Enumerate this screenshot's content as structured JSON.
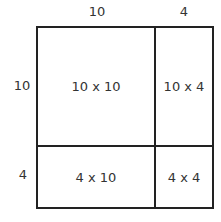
{
  "diagram": {
    "top_labels": [
      "10",
      "4"
    ],
    "side_labels": [
      "10",
      "4"
    ],
    "cells": [
      {
        "label": "10 x 10"
      },
      {
        "label": "10 x 4"
      },
      {
        "label": "4 x 10"
      },
      {
        "label": "4 x 4"
      }
    ],
    "colors": {
      "line": "#222222",
      "text": "#333333",
      "background": "#ffffff"
    }
  }
}
